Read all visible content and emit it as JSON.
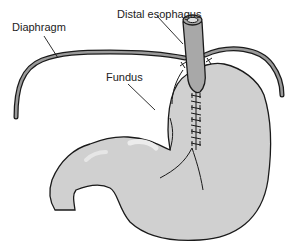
{
  "diagram": {
    "labels": {
      "diaphragm": "Diaphragm",
      "distal_esophagus": "Distal esophagus",
      "fundus": "Fundus"
    },
    "colors": {
      "stomach_fill": "#d0d0d0",
      "highlight": "#e6e6e6",
      "esophagus_fill": "#a8a8a8",
      "diaphragm_fill": "#9a9a9a",
      "outline": "#1a1a1a",
      "text": "#222222"
    }
  }
}
